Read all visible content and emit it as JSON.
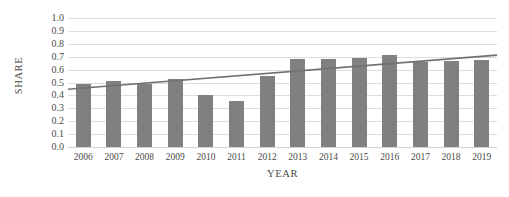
{
  "chart_data": {
    "type": "bar",
    "title": "",
    "xlabel": "YEAR",
    "ylabel": "SHARE",
    "categories": [
      "2006",
      "2007",
      "2008",
      "2009",
      "2010",
      "2011",
      "2012",
      "2013",
      "2014",
      "2015",
      "2016",
      "2017",
      "2018",
      "2019"
    ],
    "values": [
      0.49,
      0.51,
      0.49,
      0.53,
      0.4,
      0.355,
      0.55,
      0.68,
      0.685,
      0.69,
      0.715,
      0.66,
      0.67,
      0.675
    ],
    "ylim": [
      0.0,
      1.0
    ],
    "ytick_labels": [
      "1.0",
      "0.9",
      "0.8",
      "0.7",
      "0.6",
      "0.5",
      "0.4",
      "0.3",
      "0.2",
      "0.1",
      "0.0"
    ],
    "ytick_values": [
      1.0,
      0.9,
      0.8,
      0.7,
      0.6,
      0.5,
      0.4,
      0.3,
      0.2,
      0.1,
      0.0
    ],
    "grid": true,
    "legend": "none",
    "series": [
      {
        "name": "SHARE",
        "kind": "bar",
        "color": "#808080",
        "values": [
          0.49,
          0.51,
          0.49,
          0.53,
          0.4,
          0.355,
          0.55,
          0.68,
          0.685,
          0.69,
          0.715,
          0.66,
          0.67,
          0.675
        ]
      },
      {
        "name": "Linear trendline",
        "kind": "line",
        "color": "#707070",
        "start_value": 0.448,
        "end_value": 0.712
      }
    ],
    "colors": {
      "bar": "#808080",
      "trendline": "#707070",
      "gridline": "#dcdcdc",
      "text": "#4a4a4a",
      "background": "#ffffff"
    }
  }
}
